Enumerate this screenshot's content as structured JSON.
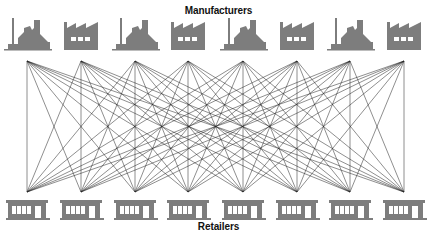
{
  "diagram": {
    "top_label": "Manufacturers",
    "bottom_label": "Retailers",
    "manufacturers": [
      {
        "type": "old-factory",
        "x": 27
      },
      {
        "type": "sawtooth-factory",
        "x": 81
      },
      {
        "type": "old-factory",
        "x": 135
      },
      {
        "type": "sawtooth-factory",
        "x": 188
      },
      {
        "type": "old-factory",
        "x": 243
      },
      {
        "type": "sawtooth-factory",
        "x": 297
      },
      {
        "type": "old-factory",
        "x": 350
      },
      {
        "type": "sawtooth-factory",
        "x": 404
      }
    ],
    "retailers": [
      {
        "type": "store",
        "x": 27
      },
      {
        "type": "store",
        "x": 81
      },
      {
        "type": "store",
        "x": 135
      },
      {
        "type": "store",
        "x": 188
      },
      {
        "type": "store",
        "x": 243
      },
      {
        "type": "store",
        "x": 297
      },
      {
        "type": "store",
        "x": 350
      },
      {
        "type": "store",
        "x": 404
      }
    ],
    "connection_top_y": 61,
    "connection_bottom_y": 192,
    "connection_style": "every manufacturer connected to every retailer",
    "colors": {
      "icon": "#7d7d7d",
      "line": "#222222",
      "text": "#111111"
    }
  }
}
